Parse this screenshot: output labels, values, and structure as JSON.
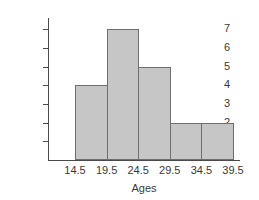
{
  "chart_data": {
    "type": "bar",
    "title": "",
    "xlabel": "Ages",
    "ylabel": "Frequency",
    "categories": [
      "14.5-19.5",
      "19.5-24.5",
      "24.5-29.5",
      "29.5-34.5",
      "34.5-39.5"
    ],
    "bin_edges": [
      "14.5",
      "19.5",
      "24.5",
      "29.5",
      "34.5",
      "39.5"
    ],
    "values": [
      4,
      7,
      5,
      2,
      2
    ],
    "xtick_labels": [
      "14.5",
      "19.5",
      "24.5",
      "29.5",
      "34.5",
      "39.5"
    ],
    "ytick_labels": [
      "1",
      "2",
      "3",
      "4",
      "5",
      "6",
      "7"
    ],
    "ylim": [
      0,
      7.6
    ],
    "xlim": [
      14.5,
      39.5
    ],
    "grid": false,
    "legend": null,
    "bar_fill_color": "#c6c6c6",
    "bar_edge_color": "#6e6e6e",
    "axis_color": "#4a4a4a",
    "background_color": "#ffffff"
  }
}
